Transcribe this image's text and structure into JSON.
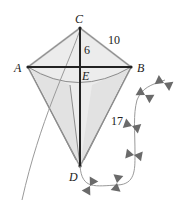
{
  "figure": {
    "type": "kite-geometry",
    "vertices": {
      "A": {
        "label": "A",
        "x": 28,
        "y": 67
      },
      "B": {
        "label": "B",
        "x": 131,
        "y": 67
      },
      "C": {
        "label": "C",
        "x": 80,
        "y": 28
      },
      "D": {
        "label": "D",
        "x": 80,
        "y": 166
      },
      "E": {
        "label": "E",
        "x": 80,
        "y": 67
      }
    },
    "measurements": {
      "CE": "6",
      "CB": "10",
      "BD": "17"
    },
    "colors": {
      "kite_fill": "#e9e9e9",
      "kite_edge": "#9a9a9a",
      "diagonals": "#222222",
      "string": "#9a9a9a",
      "bows": "#666666",
      "text": "#222222"
    },
    "bow_count": 6
  }
}
